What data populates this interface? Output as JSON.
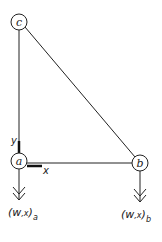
{
  "diagram": {
    "nodes": [
      {
        "id": "c",
        "label": "c"
      },
      {
        "id": "a",
        "label": "a"
      },
      {
        "id": "b",
        "label": "b"
      }
    ],
    "edges": [
      {
        "from": "c",
        "to": "a"
      },
      {
        "from": "c",
        "to": "b"
      },
      {
        "from": "a",
        "to": "b"
      }
    ],
    "axes": {
      "x_label": "x",
      "y_label": "y"
    },
    "loads": [
      {
        "node": "a",
        "label_main": "(w",
        "label_comma": ",x",
        "label_close": ")",
        "label_sub": "a"
      },
      {
        "node": "b",
        "label_main": "(w",
        "label_comma": ",x",
        "label_close": ")",
        "label_sub": "b"
      }
    ]
  }
}
